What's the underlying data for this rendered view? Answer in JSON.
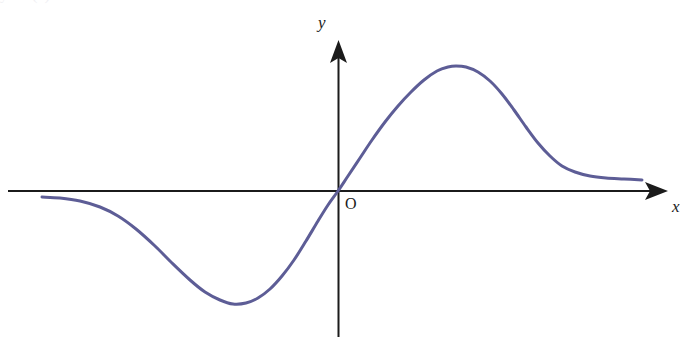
{
  "figure": {
    "name": "coordinate-plane-odd-function-graph",
    "background_color": "#ffffff",
    "width": 697,
    "height": 356
  },
  "labels": {
    "y_axis": "y",
    "x_axis": "x",
    "origin": "O"
  },
  "top_artifact": {
    "text": "y = f (x)"
  },
  "chart_data": {
    "type": "line",
    "title": "",
    "subtitle": "",
    "xlabel": "x",
    "ylabel": "y",
    "origin_label": "O",
    "grid": false,
    "legend": null,
    "axes": {
      "x_axis": {
        "pixel_y": 191,
        "pixel_x_start": 8,
        "pixel_x_end": 668,
        "arrow": "right",
        "color": "#1b1b1b",
        "width_px": 2
      },
      "y_axis": {
        "pixel_x": 338,
        "pixel_y_start": 337,
        "pixel_y_end": 40,
        "arrow": "up",
        "color": "#1b1b1b",
        "width_px": 2
      }
    },
    "xlim": [
      8,
      668
    ],
    "ylim": [
      40,
      337
    ],
    "series": [
      {
        "name": "f(x)",
        "color": "#5d5d96",
        "width_px": 3,
        "description": "Odd, S-shaped bell-derivative curve: negative bump left of origin, passes through origin with steep positive slope, positive bump right of origin, flattening toward both tails.",
        "points_px": [
          [
            42,
            197
          ],
          [
            60,
            198
          ],
          [
            80,
            201
          ],
          [
            100,
            207
          ],
          [
            118,
            216
          ],
          [
            136,
            229
          ],
          [
            155,
            246
          ],
          [
            172,
            263
          ],
          [
            190,
            280
          ],
          [
            205,
            292
          ],
          [
            220,
            300
          ],
          [
            233,
            304
          ],
          [
            246,
            303
          ],
          [
            258,
            298
          ],
          [
            270,
            289
          ],
          [
            282,
            276
          ],
          [
            294,
            260
          ],
          [
            306,
            241
          ],
          [
            318,
            221
          ],
          [
            328,
            205
          ],
          [
            338,
            191
          ],
          [
            348,
            176
          ],
          [
            360,
            158
          ],
          [
            372,
            140
          ],
          [
            385,
            122
          ],
          [
            398,
            106
          ],
          [
            411,
            92
          ],
          [
            424,
            80
          ],
          [
            437,
            71
          ],
          [
            448,
            67
          ],
          [
            456,
            66
          ],
          [
            466,
            67
          ],
          [
            478,
            72
          ],
          [
            490,
            81
          ],
          [
            502,
            94
          ],
          [
            514,
            110
          ],
          [
            526,
            127
          ],
          [
            538,
            143
          ],
          [
            550,
            156
          ],
          [
            562,
            166
          ],
          [
            575,
            172
          ],
          [
            590,
            176
          ],
          [
            606,
            178
          ],
          [
            624,
            179
          ],
          [
            642,
            180
          ]
        ]
      }
    ],
    "features": {
      "left_tail_start_px": [
        42,
        197
      ],
      "minimum_px": [
        233,
        304
      ],
      "origin_crossing_px": [
        338,
        191
      ],
      "maximum_px": [
        456,
        66
      ],
      "right_tail_end_px": [
        642,
        180
      ]
    }
  }
}
